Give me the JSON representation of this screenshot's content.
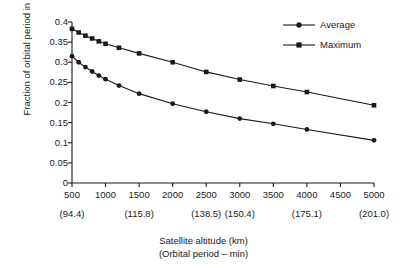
{
  "chart_data": {
    "type": "line",
    "title": "",
    "xlabel": "Satellite altitude (km)",
    "xlabel_secondary": "(Orbital period – min)",
    "ylabel": "Fraction of orbital period in shadow",
    "xlim": [
      500,
      5000
    ],
    "ylim": [
      0,
      0.4
    ],
    "grid": false,
    "legend_position": "top-right",
    "xticks": [
      500,
      1000,
      1500,
      2000,
      2500,
      3000,
      3500,
      4000,
      4500,
      5000
    ],
    "xtick_labels": [
      "500",
      "1000",
      "1500",
      "2000",
      "2500",
      "3000",
      "3500",
      "4000",
      "4500",
      "5000"
    ],
    "xticks_secondary": [
      500,
      1500,
      2500,
      3000,
      4000,
      5000
    ],
    "xtick_secondary_labels": [
      "(94.4)",
      "(115.8)",
      "(138.5)",
      "(150.4)",
      "(175.1)",
      "(201.0)"
    ],
    "yticks": [
      0,
      0.05,
      0.1,
      0.15,
      0.2,
      0.25,
      0.3,
      0.35,
      0.4
    ],
    "ytick_labels": [
      "0",
      "0.05",
      "0.1",
      "0.15",
      "0.2",
      "0.25",
      "0.3",
      "0.35",
      "0.4"
    ],
    "series": [
      {
        "name": "Maximum",
        "marker": "square",
        "color": "#1a1a1a",
        "x": [
          500,
          600,
          700,
          800,
          900,
          1000,
          1200,
          1500,
          2000,
          2500,
          3000,
          3500,
          4000,
          5000
        ],
        "values": [
          0.383,
          0.374,
          0.366,
          0.359,
          0.352,
          0.346,
          0.336,
          0.322,
          0.3,
          0.276,
          0.257,
          0.241,
          0.226,
          0.193
        ]
      },
      {
        "name": "Average",
        "marker": "circle",
        "color": "#1a1a1a",
        "x": [
          500,
          600,
          700,
          800,
          900,
          1000,
          1200,
          1500,
          2000,
          2500,
          3000,
          3500,
          4000,
          5000
        ],
        "values": [
          0.315,
          0.3,
          0.288,
          0.277,
          0.267,
          0.258,
          0.242,
          0.222,
          0.197,
          0.177,
          0.16,
          0.147,
          0.133,
          0.106
        ]
      }
    ],
    "legend": [
      {
        "label": "Average",
        "marker": "circle"
      },
      {
        "label": "Maximum",
        "marker": "square"
      }
    ]
  }
}
